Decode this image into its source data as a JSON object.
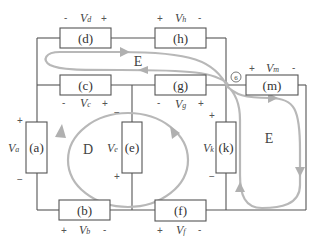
{
  "diagram": {
    "type": "circuit-loops",
    "elements": [
      {
        "id": "a",
        "label": "(a)",
        "voltage": "V",
        "sub": "a",
        "polarity": [
          "+",
          "−"
        ]
      },
      {
        "id": "b",
        "label": "(b)",
        "voltage": "V",
        "sub": "b",
        "polarity": [
          "+",
          "-"
        ]
      },
      {
        "id": "c",
        "label": "(c)",
        "voltage": "V",
        "sub": "c",
        "polarity": [
          "-",
          "+"
        ]
      },
      {
        "id": "d",
        "label": "(d)",
        "voltage": "V",
        "sub": "d",
        "polarity": [
          "-",
          "+"
        ]
      },
      {
        "id": "e",
        "label": "(e)",
        "voltage": "V",
        "sub": "e",
        "polarity": [
          "−",
          "+"
        ]
      },
      {
        "id": "f",
        "label": "(f)",
        "voltage": "V",
        "sub": "f",
        "polarity": [
          "+",
          "-"
        ]
      },
      {
        "id": "g",
        "label": "(g)",
        "voltage": "V",
        "sub": "g",
        "polarity": [
          "-",
          "+"
        ]
      },
      {
        "id": "h",
        "label": "(h)",
        "voltage": "V",
        "sub": "h",
        "polarity": [
          "+",
          "-"
        ]
      },
      {
        "id": "k",
        "label": "(k)",
        "voltage": "V",
        "sub": "k",
        "polarity": [
          "+",
          "−"
        ]
      },
      {
        "id": "m",
        "label": "(m)",
        "voltage": "V",
        "sub": "m",
        "polarity": [
          "+",
          "-"
        ]
      }
    ],
    "loops": [
      {
        "name": "D"
      },
      {
        "name": "E"
      },
      {
        "name": "E"
      }
    ],
    "node": {
      "label": "6"
    },
    "colors": {
      "wire": "#555555",
      "loop": "#b8b8b8",
      "text": "#333333"
    }
  }
}
